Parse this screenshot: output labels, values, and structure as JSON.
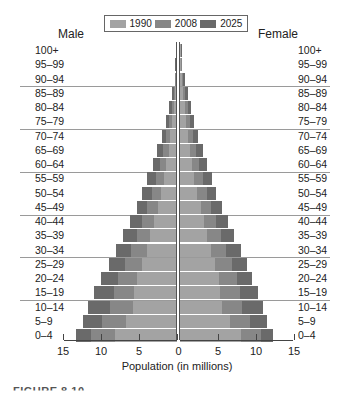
{
  "chart_data": {
    "type": "bar",
    "subtype": "population-pyramid",
    "title": "",
    "left_title": "Male",
    "right_title": "Female",
    "xlabel": "Population (in millions)",
    "ylabel": "",
    "xlim": [
      15,
      15
    ],
    "x_ticks_left": [
      15,
      10,
      5,
      0
    ],
    "x_ticks_right": [
      5,
      10,
      15
    ],
    "x_tick_labels": [
      "15",
      "10",
      "5",
      "0",
      "5",
      "10",
      "15"
    ],
    "legend_position": "top-center",
    "grid": "horizontal lines every 3 age groups",
    "categories": [
      "100+",
      "95–99",
      "90–94",
      "85–89",
      "80–84",
      "75–79",
      "70–74",
      "65–69",
      "60–64",
      "55–59",
      "50–54",
      "45–49",
      "40–44",
      "35–39",
      "30–34",
      "25–29",
      "20–24",
      "15–19",
      "10–14",
      "5–9",
      "0–4"
    ],
    "series": [
      {
        "name": "1990",
        "color": "#a3a3a3",
        "male": [
          0.05,
          0.1,
          0.1,
          0.2,
          0.4,
          0.6,
          0.9,
          1.1,
          1.4,
          1.7,
          2.1,
          2.5,
          3.0,
          3.5,
          4.0,
          4.6,
          5.2,
          5.6,
          5.8,
          6.7,
          8.2
        ],
        "female": [
          0.1,
          0.1,
          0.2,
          0.4,
          0.6,
          0.8,
          1.1,
          1.3,
          1.6,
          1.9,
          2.3,
          2.7,
          3.1,
          3.6,
          4.1,
          4.6,
          5.1,
          5.3,
          5.5,
          6.6,
          8.0
        ]
      },
      {
        "name": "2008",
        "color": "#878787",
        "male": [
          0.05,
          0.1,
          0.2,
          0.4,
          0.7,
          1.0,
          1.4,
          1.8,
          2.2,
          2.7,
          3.3,
          3.9,
          4.6,
          5.3,
          6.1,
          6.9,
          7.7,
          8.3,
          8.8,
          9.9,
          11.3
        ],
        "female": [
          0.1,
          0.2,
          0.4,
          0.7,
          1.0,
          1.3,
          1.7,
          2.1,
          2.5,
          3.0,
          3.5,
          4.1,
          4.7,
          5.4,
          6.1,
          6.9,
          7.5,
          7.9,
          8.2,
          9.2,
          10.7
        ]
      },
      {
        "name": "2025",
        "color": "#6a6a6a",
        "male": [
          0.1,
          0.2,
          0.3,
          0.6,
          1.0,
          1.5,
          2.0,
          2.6,
          3.2,
          3.9,
          4.6,
          5.3,
          6.2,
          7.1,
          8.0,
          9.0,
          10.0,
          10.9,
          11.7,
          12.4,
          13.3
        ],
        "female": [
          0.2,
          0.3,
          0.6,
          1.0,
          1.4,
          1.9,
          2.4,
          3.0,
          3.6,
          4.2,
          4.8,
          5.5,
          6.3,
          7.1,
          8.0,
          8.8,
          9.5,
          10.2,
          10.9,
          11.5,
          12.3
        ]
      }
    ]
  },
  "legend": [
    {
      "label": "1990",
      "color": "#a3a3a3"
    },
    {
      "label": "2008",
      "color": "#878787"
    },
    {
      "label": "2025",
      "color": "#6a6a6a"
    }
  ],
  "caption": "FIGURE 8.10"
}
